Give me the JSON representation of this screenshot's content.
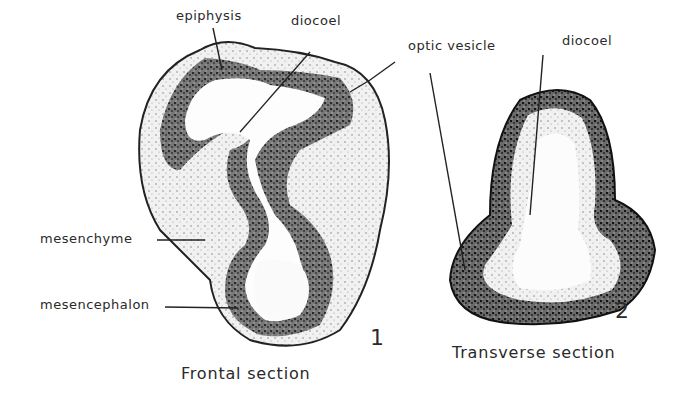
{
  "figure_1": {
    "number": "1",
    "caption": "Frontal section",
    "labels": {
      "epiphysis": "epiphysis",
      "diocoel": "diocoel",
      "mesenchyme": "mesenchyme",
      "mesencephalon": "mesencephalon"
    }
  },
  "figure_2": {
    "number": "2",
    "caption": "Transverse section",
    "labels": {
      "optic_vesicle": "optic vesicle",
      "diocoel": "diocoel"
    }
  },
  "colors": {
    "tissue_dark": "#1a1a1a",
    "tissue_mid": "#555555",
    "tissue_light": "#bbbbbb",
    "background": "#ffffff"
  }
}
